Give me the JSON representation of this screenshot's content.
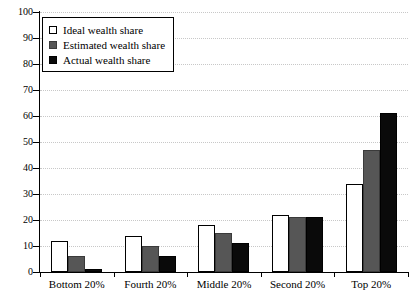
{
  "chart_data": {
    "type": "bar",
    "title": "",
    "xlabel": "",
    "ylabel": "",
    "ylim": [
      0,
      100
    ],
    "ytick_step": 10,
    "grid": true,
    "legend_position": "top-left",
    "categories": [
      "Bottom 20%",
      "Fourth 20%",
      "Middle 20%",
      "Second 20%",
      "Top 20%"
    ],
    "yticks": [
      "0",
      "10",
      "20",
      "30",
      "40",
      "50",
      "60",
      "70",
      "80",
      "90",
      "100"
    ],
    "series": [
      {
        "name": "Ideal wealth share",
        "color": "#ffffff",
        "values": [
          12,
          14,
          18,
          22,
          34
        ]
      },
      {
        "name": "Estimated wealth share",
        "color": "#565656",
        "values": [
          6,
          10,
          15,
          21,
          47
        ]
      },
      {
        "name": "Actual wealth share",
        "color": "#0a0a0a",
        "values": [
          1,
          6,
          11,
          21,
          61
        ]
      }
    ]
  },
  "legend": {
    "items": [
      {
        "label": "Ideal wealth share",
        "swatch": "white-square-icon"
      },
      {
        "label": "Estimated wealth share",
        "swatch": "gray-square-icon"
      },
      {
        "label": "Actual wealth share",
        "swatch": "black-square-icon"
      }
    ]
  }
}
